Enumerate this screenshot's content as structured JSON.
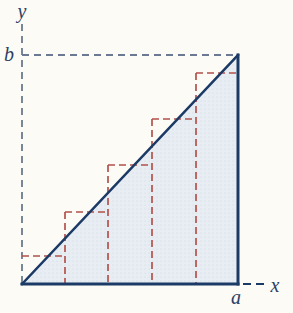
{
  "figure": {
    "type": "math-diagram",
    "labels": {
      "y": "y",
      "b": "b",
      "a": "a",
      "x": "x"
    },
    "colors": {
      "background": "#fcfbf5",
      "triangle_fill": "#e7edf2",
      "stipple_dot": "#ccd9e4",
      "solid_line": "#1c3a66",
      "axis_dash": "#6b7a92",
      "step_dash": "#b2524b",
      "label_text": "#2c4066"
    },
    "geometry": {
      "width": 293,
      "height": 313,
      "origin": [
        22,
        284
      ],
      "base_right": [
        238,
        284
      ],
      "apex": [
        238,
        55
      ],
      "y_axis_top": 24,
      "b_guide_y": 55,
      "x_dash_start": 243,
      "x_dash_end": 264,
      "steps_count": 5,
      "step_x_bounds": [
        22,
        65,
        108,
        152,
        196,
        238
      ],
      "step_tops": [
        256,
        212,
        165,
        119,
        73
      ]
    }
  }
}
